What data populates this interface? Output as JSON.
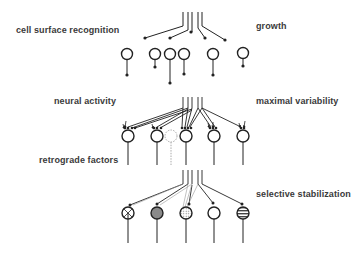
{
  "labels": {
    "cell_surface_recognition": "cell surface recognition",
    "growth": "growth",
    "neural_activity": "neural activity",
    "maximal_variability": "maximal variability",
    "retrograde_factors": "retrograde factors",
    "selective_stabilization": "selective stabilization"
  },
  "colors": {
    "stroke": "#222222",
    "text": "#3a3a3a",
    "gray_fill": "#8a8a8a",
    "dashed_neuron": "#aaaaaa"
  },
  "stages": [
    {
      "name": "growth",
      "neuron_count": 6
    },
    {
      "name": "maximal variability",
      "neuron_count": 5,
      "degenerating_neuron": 1
    },
    {
      "name": "selective stabilization",
      "neuron_count": 5,
      "fill_patterns": [
        "crosshatch",
        "gray",
        "dotted",
        "none",
        "striped"
      ]
    }
  ]
}
